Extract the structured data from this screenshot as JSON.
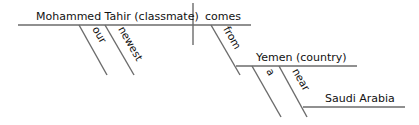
{
  "diagram": {
    "type": "sentence-diagram",
    "subject": "Mohammed Tahir (classmate)",
    "verb": "comes",
    "subject_modifiers": [
      "our",
      "newest"
    ],
    "verb_modifier": {
      "preposition": "from",
      "object": "Yemen (country)",
      "object_modifiers": [
        "a"
      ],
      "nested_preposition": {
        "preposition": "near",
        "object": "Saudi Arabia"
      }
    }
  },
  "colors": {
    "line": "#6b6b6b",
    "text": "#111111"
  }
}
